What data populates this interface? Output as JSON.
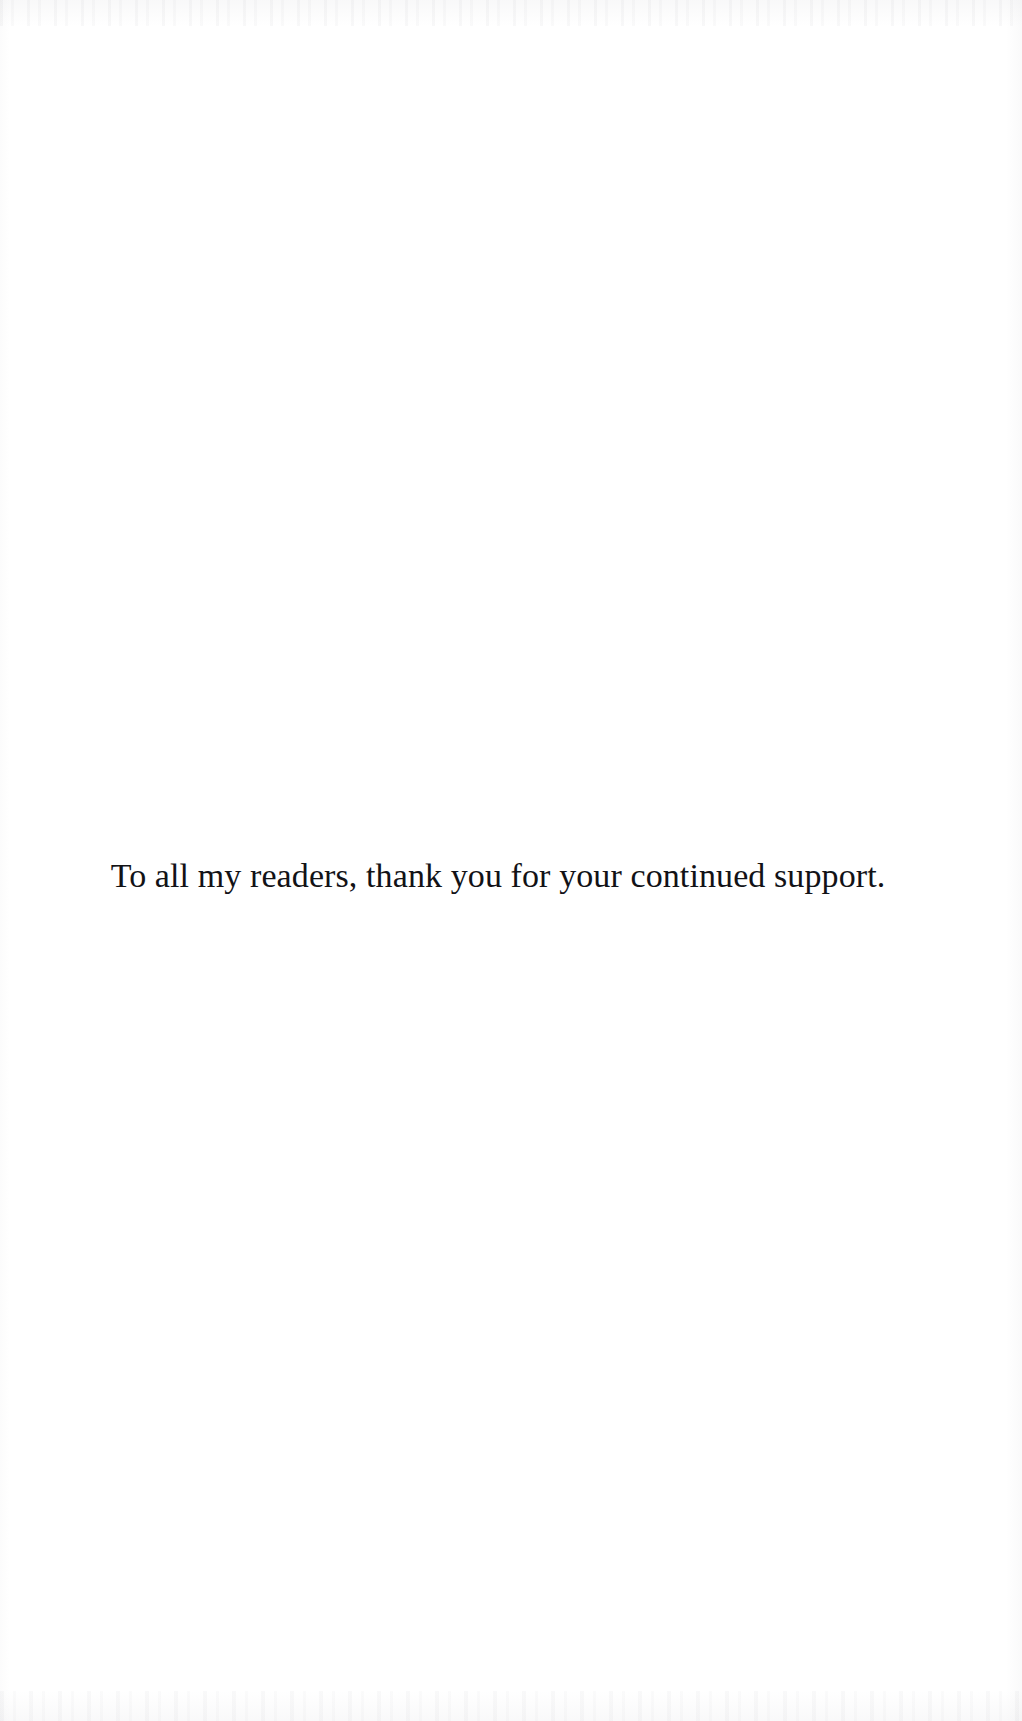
{
  "page": {
    "kind": "book-dedication-page",
    "background_color": "#ffffff",
    "text_color": "#121216"
  },
  "dedication": {
    "text": "To all my readers, thank you for your continued support."
  },
  "artifacts": {
    "top_edge_label": "scan-artifact-top",
    "bottom_edge_label": "scan-artifact-bottom",
    "left_edge_label": "scan-artifact-left",
    "right_edge_label": "scan-artifact-right"
  }
}
